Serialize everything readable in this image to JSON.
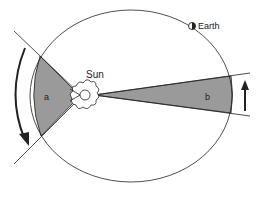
{
  "diagram": {
    "labels": {
      "sun": "Sun",
      "earth": "Earth",
      "sector_a": "a",
      "sector_b": "b"
    },
    "colors": {
      "sector_fill": "#9a9a9a",
      "line": "#222222",
      "background": "#ffffff"
    }
  }
}
